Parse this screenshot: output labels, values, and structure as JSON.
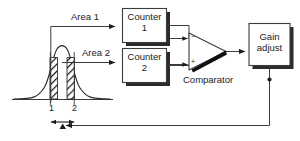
{
  "diagram": {
    "background_color": "#ffffff",
    "line_color": "#3c3c3c",
    "ink_color": "#1b1b1b",
    "shadow_color": "#2b2b2b",
    "signals": {
      "area1_label": "Area 1",
      "area2_label": "Area 2"
    },
    "blocks": [
      {
        "id": "counter1",
        "line1": "Counter",
        "line2": "1"
      },
      {
        "id": "counter2",
        "line1": "Counter",
        "line2": "2"
      },
      {
        "id": "gain-adjust",
        "line1": "Gain",
        "line2": "adjust"
      }
    ],
    "comparator": {
      "label": "Comparator",
      "minus_sign": "−",
      "plus_sign": "+"
    },
    "plot": {
      "gate_labels": [
        "1",
        "2"
      ],
      "hatch_fill": "diagonal-stripes",
      "curve_type": "gaussian-peak"
    }
  }
}
